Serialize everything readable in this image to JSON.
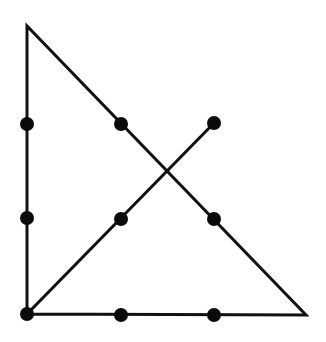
{
  "diagram": {
    "type": "nine-dots-puzzle-solution",
    "background": "#ffffff",
    "stroke_color": "#111111",
    "dot_color": "#0a0a0a",
    "stroke_width": 3,
    "dot_radius": 7,
    "dots": [
      {
        "row": 0,
        "col": 0,
        "x": 27,
        "y": 124
      },
      {
        "row": 0,
        "col": 1,
        "x": 121,
        "y": 124
      },
      {
        "row": 0,
        "col": 2,
        "x": 214,
        "y": 123
      },
      {
        "row": 1,
        "col": 0,
        "x": 27,
        "y": 218
      },
      {
        "row": 1,
        "col": 1,
        "x": 121,
        "y": 219
      },
      {
        "row": 1,
        "col": 2,
        "x": 214,
        "y": 219
      },
      {
        "row": 2,
        "col": 0,
        "x": 27,
        "y": 314
      },
      {
        "row": 2,
        "col": 1,
        "x": 121,
        "y": 315
      },
      {
        "row": 2,
        "col": 2,
        "x": 214,
        "y": 315
      }
    ],
    "path_points": [
      {
        "x": 214,
        "y": 123
      },
      {
        "x": 27,
        "y": 314
      },
      {
        "x": 27,
        "y": 26
      },
      {
        "x": 306,
        "y": 315
      },
      {
        "x": 27,
        "y": 314
      }
    ]
  }
}
